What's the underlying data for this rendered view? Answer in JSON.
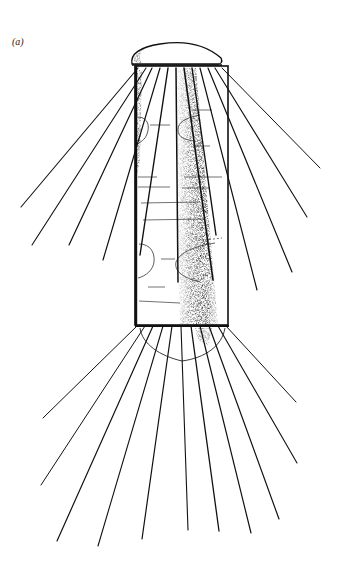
{
  "figure": {
    "panel_label": "(a)",
    "colors": {
      "ink": "#111111",
      "background": "#ffffff",
      "stipple": "#333333"
    },
    "cell": {
      "x": 135,
      "y": 65,
      "width": 93,
      "height": 260
    },
    "upper_cap": {
      "x1": 132,
      "x2": 221,
      "base_y": 64,
      "top_y": 43
    },
    "lower_cap": {
      "x1": 140,
      "x2": 225,
      "top_y": 327,
      "bottom_y": 361
    },
    "upper_spines": [
      {
        "from": [
          138,
          68
        ],
        "to": [
          21,
          207
        ]
      },
      {
        "from": [
          146,
          68
        ],
        "to": [
          32,
          245
        ]
      },
      {
        "from": [
          152,
          68
        ],
        "to": [
          69,
          245
        ]
      },
      {
        "from": [
          160,
          68
        ],
        "to": [
          103,
          260
        ]
      },
      {
        "from": [
          168,
          68
        ],
        "to": [
          140,
          255
        ]
      },
      {
        "from": [
          176,
          68
        ],
        "to": [
          178,
          282
        ]
      },
      {
        "from": [
          184,
          68
        ],
        "to": [
          213,
          280
        ]
      },
      {
        "from": [
          192,
          68
        ],
        "to": [
          216,
          235
        ]
      },
      {
        "from": [
          200,
          68
        ],
        "to": [
          257,
          290
        ]
      },
      {
        "from": [
          208,
          68
        ],
        "to": [
          292,
          272
        ]
      },
      {
        "from": [
          215,
          68
        ],
        "to": [
          307,
          217
        ]
      },
      {
        "from": [
          222,
          68
        ],
        "to": [
          320,
          168
        ]
      }
    ],
    "lower_spines": [
      {
        "from": [
          137,
          326
        ],
        "to": [
          43,
          418
        ]
      },
      {
        "from": [
          145,
          326
        ],
        "to": [
          41,
          485
        ]
      },
      {
        "from": [
          153,
          326
        ],
        "to": [
          57,
          541
        ]
      },
      {
        "from": [
          163,
          326
        ],
        "to": [
          98,
          546
        ]
      },
      {
        "from": [
          172,
          326
        ],
        "to": [
          142,
          539
        ]
      },
      {
        "from": [
          181,
          326
        ],
        "to": [
          188,
          530
        ]
      },
      {
        "from": [
          191,
          326
        ],
        "to": [
          219,
          531
        ]
      },
      {
        "from": [
          200,
          326
        ],
        "to": [
          251,
          533
        ]
      },
      {
        "from": [
          209,
          326
        ],
        "to": [
          279,
          519
        ]
      },
      {
        "from": [
          218,
          326
        ],
        "to": [
          297,
          463
        ]
      },
      {
        "from": [
          226,
          326
        ],
        "to": [
          296,
          402
        ]
      }
    ]
  }
}
